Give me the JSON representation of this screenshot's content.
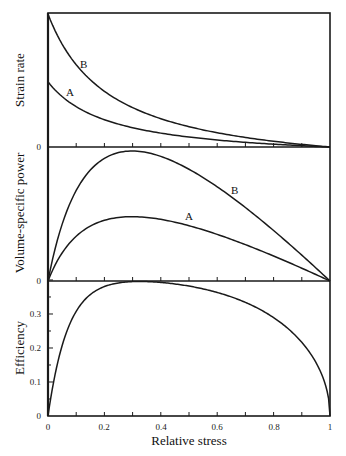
{
  "chart_data": [
    {
      "type": "line",
      "title": "",
      "ylabel": "Strain rate",
      "xlabel": "",
      "xlim": [
        0,
        1
      ],
      "ytick_labels": [
        "0"
      ],
      "series": [
        {
          "name": "B",
          "label": "B",
          "start": 1.0,
          "a": 0.22
        },
        {
          "name": "A",
          "label": "A",
          "start": 0.49,
          "a": 0.22
        }
      ],
      "x": [
        0,
        0.1,
        0.2,
        0.3,
        0.4,
        0.5,
        0.6,
        0.7,
        0.8,
        0.9,
        1.0
      ],
      "values_B": [
        1.0,
        0.62,
        0.38,
        0.24,
        0.15,
        0.1,
        0.06,
        0.04,
        0.02,
        0.01,
        0
      ],
      "values_A": [
        0.49,
        0.3,
        0.19,
        0.12,
        0.08,
        0.05,
        0.03,
        0.02,
        0.01,
        0.005,
        0
      ]
    },
    {
      "type": "line",
      "title": "",
      "ylabel": "Volume-specific power",
      "xlabel": "",
      "xlim": [
        0,
        1
      ],
      "ytick_labels": [
        "0"
      ],
      "series": [
        {
          "name": "B",
          "label": "B",
          "peak_x": 0.27,
          "peak_relative": 0.97
        },
        {
          "name": "A",
          "label": "A",
          "peak_x": 0.27,
          "peak_relative": 0.48
        }
      ]
    },
    {
      "type": "line",
      "title": "",
      "ylabel": "Efficiency",
      "xlabel": "Relative stress",
      "xlim": [
        0,
        1
      ],
      "ylim": [
        0,
        0.4
      ],
      "yticks": [
        0,
        0.1,
        0.2,
        0.3
      ],
      "ytick_labels": [
        "0",
        "0.1",
        "0.2",
        "0.3"
      ],
      "xticks": [
        0,
        0.2,
        0.4,
        0.6,
        0.8,
        1
      ],
      "xtick_labels": [
        "0",
        "0.2",
        "0.4",
        "0.6",
        "0.8",
        "1"
      ],
      "series": [
        {
          "name": "Efficiency",
          "peak_x": 0.55,
          "peak_value": 0.39
        }
      ],
      "x": [
        0,
        0.05,
        0.1,
        0.2,
        0.3,
        0.4,
        0.5,
        0.6,
        0.7,
        0.8,
        0.9,
        0.95,
        1.0
      ],
      "values": [
        0,
        0.16,
        0.24,
        0.315,
        0.35,
        0.375,
        0.387,
        0.385,
        0.37,
        0.33,
        0.24,
        0.15,
        0
      ]
    }
  ],
  "labels": {
    "panel1_ylabel": "Strain rate",
    "panel2_ylabel": "Volume-specific power",
    "panel3_ylabel": "Efficiency",
    "xlabel": "Relative stress",
    "curve_B": "B",
    "curve_A": "A",
    "zero": "0"
  },
  "colors": {
    "line": "#1a1a1a",
    "background": "#ffffff"
  }
}
